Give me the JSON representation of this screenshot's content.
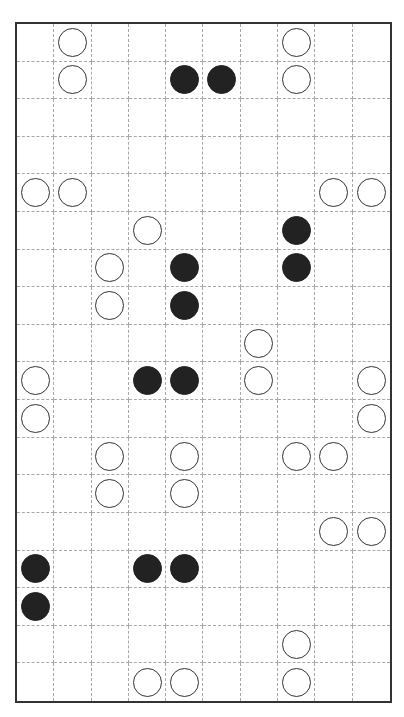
{
  "puzzle": {
    "cols": 10,
    "rows": 18,
    "colors": {
      "border": "#333333",
      "grid_line": "#a8a8a8",
      "white_stone_fill": "#ffffff",
      "white_stone_stroke": "#333333",
      "black_stone_fill": "#222222"
    },
    "stones": [
      {
        "row": 0,
        "col": 1,
        "color": "white"
      },
      {
        "row": 0,
        "col": 7,
        "color": "white"
      },
      {
        "row": 1,
        "col": 1,
        "color": "white"
      },
      {
        "row": 1,
        "col": 4,
        "color": "black"
      },
      {
        "row": 1,
        "col": 5,
        "color": "black"
      },
      {
        "row": 1,
        "col": 7,
        "color": "white"
      },
      {
        "row": 4,
        "col": 0,
        "color": "white"
      },
      {
        "row": 4,
        "col": 1,
        "color": "white"
      },
      {
        "row": 4,
        "col": 8,
        "color": "white"
      },
      {
        "row": 4,
        "col": 9,
        "color": "white"
      },
      {
        "row": 5,
        "col": 3,
        "color": "white"
      },
      {
        "row": 5,
        "col": 7,
        "color": "black"
      },
      {
        "row": 6,
        "col": 2,
        "color": "white"
      },
      {
        "row": 6,
        "col": 4,
        "color": "black"
      },
      {
        "row": 6,
        "col": 7,
        "color": "black"
      },
      {
        "row": 7,
        "col": 2,
        "color": "white"
      },
      {
        "row": 7,
        "col": 4,
        "color": "black"
      },
      {
        "row": 8,
        "col": 6,
        "color": "white"
      },
      {
        "row": 9,
        "col": 0,
        "color": "white"
      },
      {
        "row": 9,
        "col": 3,
        "color": "black"
      },
      {
        "row": 9,
        "col": 4,
        "color": "black"
      },
      {
        "row": 9,
        "col": 6,
        "color": "white"
      },
      {
        "row": 9,
        "col": 9,
        "color": "white"
      },
      {
        "row": 10,
        "col": 0,
        "color": "white"
      },
      {
        "row": 10,
        "col": 9,
        "color": "white"
      },
      {
        "row": 11,
        "col": 2,
        "color": "white"
      },
      {
        "row": 11,
        "col": 4,
        "color": "white"
      },
      {
        "row": 11,
        "col": 7,
        "color": "white"
      },
      {
        "row": 11,
        "col": 8,
        "color": "white"
      },
      {
        "row": 12,
        "col": 2,
        "color": "white"
      },
      {
        "row": 12,
        "col": 4,
        "color": "white"
      },
      {
        "row": 13,
        "col": 8,
        "color": "white"
      },
      {
        "row": 13,
        "col": 9,
        "color": "white"
      },
      {
        "row": 14,
        "col": 0,
        "color": "black"
      },
      {
        "row": 14,
        "col": 3,
        "color": "black"
      },
      {
        "row": 14,
        "col": 4,
        "color": "black"
      },
      {
        "row": 15,
        "col": 0,
        "color": "black"
      },
      {
        "row": 16,
        "col": 7,
        "color": "white"
      },
      {
        "row": 17,
        "col": 3,
        "color": "white"
      },
      {
        "row": 17,
        "col": 4,
        "color": "white"
      },
      {
        "row": 17,
        "col": 7,
        "color": "white"
      }
    ]
  }
}
